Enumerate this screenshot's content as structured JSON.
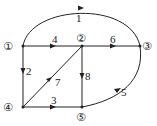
{
  "nodes": [
    {
      "id": "1",
      "label": "①"
    },
    {
      "id": "2",
      "label": "②"
    },
    {
      "id": "3",
      "label": "③"
    },
    {
      "id": "4",
      "label": "④"
    },
    {
      "id": "5",
      "label": "⑤"
    }
  ],
  "edges": [
    {
      "id": "1",
      "label": "1",
      "from": "1",
      "to": "3"
    },
    {
      "id": "2",
      "label": "2",
      "from": "1",
      "to": "4"
    },
    {
      "id": "3",
      "label": "3",
      "from": "4",
      "to": "5"
    },
    {
      "id": "4",
      "label": "4",
      "from": "1",
      "to": "2"
    },
    {
      "id": "5",
      "label": "5",
      "from": "5",
      "to": "3"
    },
    {
      "id": "6",
      "label": "6",
      "from": "2",
      "to": "3"
    },
    {
      "id": "7",
      "label": "7",
      "from": "4",
      "to": "2"
    },
    {
      "id": "8",
      "label": "8",
      "from": "2",
      "to": "5"
    }
  ],
  "colors": {
    "line": "#222222"
  }
}
